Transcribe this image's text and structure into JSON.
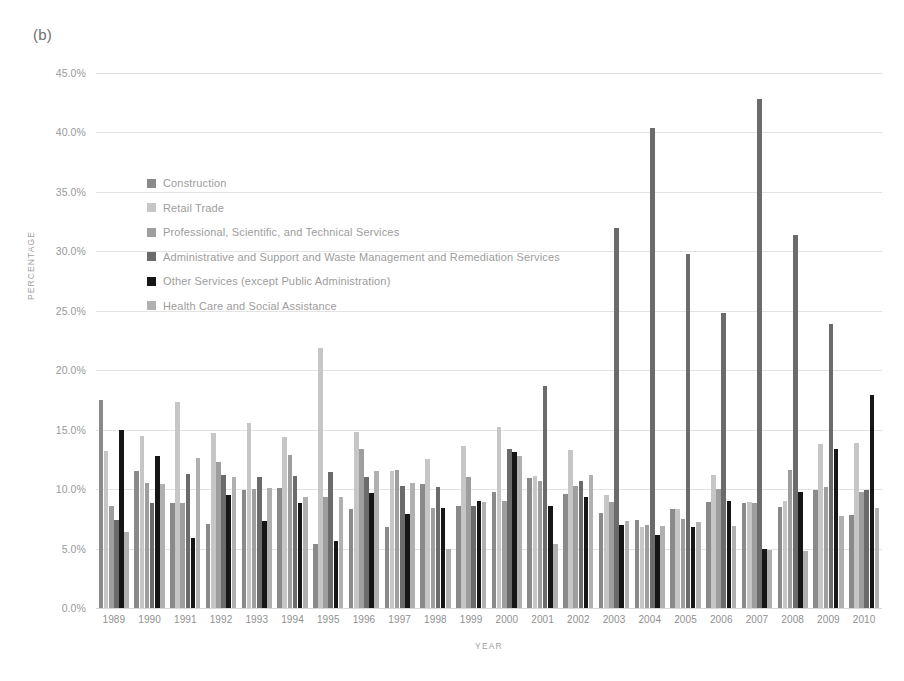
{
  "figure": {
    "panel_label": "(b)"
  },
  "chart_data": {
    "type": "bar",
    "title": "",
    "subtitle": "",
    "xlabel": "YEAR",
    "ylabel": "PERCENTAGE",
    "ylim": [
      0,
      45
    ],
    "ytick_labels": [
      "0.0%",
      "5.0%",
      "10.0%",
      "15.0%",
      "20.0%",
      "25.0%",
      "30.0%",
      "35.0%",
      "40.0%",
      "45.0%"
    ],
    "ytick_values": [
      0,
      5,
      10,
      15,
      20,
      25,
      30,
      35,
      40,
      45
    ],
    "grid": true,
    "legend_position": "inside-upper-left",
    "categories": [
      "1989",
      "1990",
      "1991",
      "1992",
      "1993",
      "1994",
      "1995",
      "1996",
      "1997",
      "1998",
      "1999",
      "2000",
      "2001",
      "2002",
      "2003",
      "2004",
      "2005",
      "2006",
      "2007",
      "2008",
      "2009",
      "2010"
    ],
    "series": [
      {
        "name": "Construction",
        "color": "#8a8a8a",
        "values": [
          17.5,
          11.5,
          8.8,
          7.1,
          9.9,
          10.1,
          5.4,
          8.3,
          6.8,
          10.4,
          8.6,
          9.8,
          10.9,
          9.6,
          8.0,
          7.4,
          8.3,
          8.9,
          8.8,
          8.5,
          9.9,
          7.8
        ]
      },
      {
        "name": "Retail Trade",
        "color": "#c6c6c6",
        "values": [
          13.2,
          14.5,
          17.3,
          14.7,
          15.6,
          14.4,
          21.9,
          14.8,
          11.5,
          12.5,
          13.6,
          15.2,
          11.1,
          13.3,
          9.5,
          6.8,
          8.3,
          11.2,
          8.9,
          9.0,
          13.8,
          13.9
        ]
      },
      {
        "name": "Professional, Scientific, and Technical Services",
        "color": "#9e9e9e",
        "values": [
          8.6,
          10.5,
          8.8,
          12.3,
          10.0,
          12.9,
          9.3,
          13.4,
          11.6,
          8.4,
          11.0,
          9.0,
          10.7,
          10.3,
          8.9,
          7.0,
          7.5,
          10.0,
          8.8,
          11.6,
          10.2,
          9.8
        ]
      },
      {
        "name": "Administrative and Support and Waste Management and Remediation Services",
        "color": "#6b6b6b",
        "values": [
          7.4,
          8.8,
          11.3,
          11.2,
          11.0,
          11.1,
          11.4,
          11.0,
          10.3,
          10.2,
          8.6,
          13.4,
          18.7,
          10.7,
          32.0,
          40.4,
          29.8,
          24.8,
          42.8,
          31.4,
          23.9,
          9.9
        ]
      },
      {
        "name": "Other Services (except Public Administration)",
        "color": "#161616",
        "values": [
          15.0,
          12.8,
          5.9,
          9.5,
          7.3,
          8.8,
          5.6,
          9.7,
          7.9,
          8.4,
          9.0,
          13.1,
          8.6,
          9.3,
          7.0,
          6.1,
          6.8,
          9.0,
          5.0,
          9.8,
          13.4,
          17.9
        ]
      },
      {
        "name": "Health Care and Social Assistance",
        "color": "#b0b0b0",
        "values": [
          6.4,
          10.4,
          12.6,
          11.0,
          10.1,
          9.3,
          9.3,
          11.5,
          10.5,
          5.0,
          8.9,
          12.8,
          5.4,
          11.2,
          7.3,
          6.9,
          7.2,
          6.9,
          4.9,
          4.8,
          7.7,
          8.4
        ]
      }
    ]
  }
}
